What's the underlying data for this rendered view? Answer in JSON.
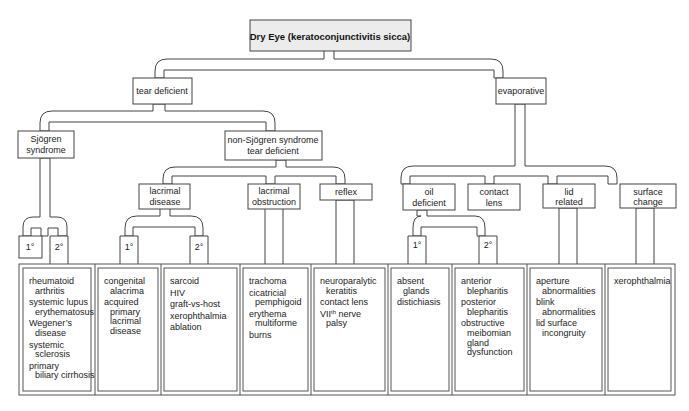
{
  "title": "Dry Eye (keratoconjunctivitis sicca)",
  "level1": {
    "tear_deficient": "tear deficient",
    "evaporative": "evaporative"
  },
  "level2": {
    "sjogren": [
      "Sjögren",
      "syndrome"
    ],
    "non_sjogren": [
      "non-Sjögren syndrome",
      "tear deficient"
    ]
  },
  "level3": {
    "lacrimal_disease": [
      "lacrimal",
      "disease"
    ],
    "lacrimal_obstruction": [
      "lacrimal",
      "obstruction"
    ],
    "reflex": [
      "reflex"
    ],
    "oil_deficient": [
      "oil",
      "deficient"
    ],
    "contact_lens": [
      "contact",
      "lens"
    ],
    "lid_related": [
      "lid",
      "related"
    ],
    "surface_change": [
      "surface",
      "change"
    ]
  },
  "grade_labels": {
    "primary": "1°",
    "secondary": "2°"
  },
  "lists": [
    {
      "id": "sjogren-2",
      "items": [
        [
          "rheumatoid",
          "arthritis"
        ],
        [
          "systemic lupus",
          "erythematosus"
        ],
        [
          "Wegener’s",
          "disease"
        ],
        [
          "systemic",
          "sclerosis"
        ],
        [
          "primary",
          "biliary cirrhosis"
        ]
      ]
    },
    {
      "id": "lacrimal-1",
      "items": [
        [
          "congenital",
          "alacrima"
        ],
        [
          "acquired",
          "primary",
          "lacrimal",
          "disease"
        ]
      ]
    },
    {
      "id": "lacrimal-2",
      "items": [
        [
          "sarcoid"
        ],
        [
          "HIV"
        ],
        [
          "graft-vs-host"
        ],
        [
          "xerophthalmia"
        ],
        [
          "ablation"
        ]
      ]
    },
    {
      "id": "obstruction",
      "items": [
        [
          "trachoma"
        ],
        [
          "cicatricial",
          "pemphigoid"
        ],
        [
          "erythema",
          "multiforme"
        ],
        [
          "burns"
        ]
      ]
    },
    {
      "id": "reflex",
      "items": [
        [
          "neuroparalytic",
          "keratitis"
        ],
        [
          "contact lens"
        ],
        [
          "VII^th nerve",
          "palsy"
        ]
      ]
    },
    {
      "id": "oil-1",
      "items": [
        [
          "absent",
          "glands"
        ],
        [
          "distichiasis"
        ]
      ]
    },
    {
      "id": "oil-2",
      "items": [
        [
          "anterior",
          "blepharitis"
        ],
        [
          "posterior",
          "blepharitis"
        ],
        [
          "obstructive",
          "meibomian",
          "gland",
          "dysfunction"
        ]
      ]
    },
    {
      "id": "lid",
      "items": [
        [
          "aperture",
          "abnormalities"
        ],
        [
          "blink",
          "abnormalities"
        ],
        [
          "lid surface",
          "incongruity"
        ]
      ]
    },
    {
      "id": "surface",
      "items": [
        [
          "xerophthalmia"
        ]
      ]
    }
  ]
}
